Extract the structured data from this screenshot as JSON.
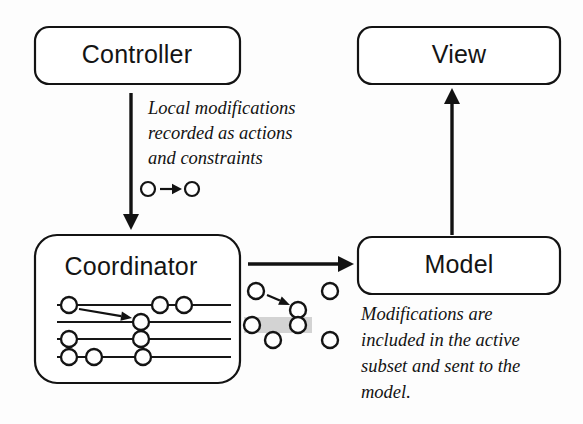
{
  "figure": {
    "background_color": "#fdfdfd",
    "ink_color": "#131313",
    "highlight_color": "#b9b9b9"
  },
  "nodes": [
    {
      "id": "controller",
      "label": "Controller",
      "x": 35,
      "y": 27,
      "w": 205,
      "h": 57,
      "r": 14
    },
    {
      "id": "view",
      "label": "View",
      "x": 358,
      "y": 27,
      "w": 202,
      "h": 57,
      "r": 14
    },
    {
      "id": "coordinator",
      "label": "Coordinator",
      "x": 35,
      "y": 235,
      "w": 205,
      "h": 148,
      "r": 22
    },
    {
      "id": "model",
      "label": "Model",
      "x": 358,
      "y": 237,
      "w": 202,
      "h": 57,
      "r": 14
    }
  ],
  "node_label_positions": [
    {
      "id": "controller-label",
      "x": 137,
      "y": 56
    },
    {
      "id": "view-label",
      "x": 459,
      "y": 56
    },
    {
      "id": "coordinator-label",
      "x": 131,
      "y": 268
    },
    {
      "id": "model-label",
      "x": 459,
      "y": 266
    }
  ],
  "connectors": [
    {
      "id": "controller-to-coordinator",
      "direction": "down",
      "x1": 131,
      "y1": 93,
      "x2": 131,
      "y2": 230
    },
    {
      "id": "coordinator-to-model",
      "direction": "right",
      "x1": 248,
      "y1": 264,
      "x2": 354,
      "y2": 264
    },
    {
      "id": "model-to-view",
      "direction": "up",
      "x1": 452,
      "y1": 235,
      "x2": 452,
      "y2": 88
    }
  ],
  "annotations": [
    {
      "id": "controller-annotation",
      "lines": [
        "Local modifications",
        "recorded as actions",
        "and constraints"
      ],
      "x": 148,
      "y_start": 110,
      "line_height": 25
    },
    {
      "id": "model-annotation",
      "lines": [
        "Modifications are",
        "included in the active",
        "subset and sent to the",
        "model."
      ],
      "x": 361,
      "y_start": 316,
      "line_height": 26
    }
  ],
  "legend": {
    "id": "action-legend",
    "description": "open circle, arrow, open circle",
    "left_circle": {
      "cx": 148,
      "cy": 189,
      "r": 7
    },
    "right_circle": {
      "cx": 192,
      "cy": 189,
      "r": 7
    },
    "arrow": {
      "x1": 160,
      "y1": 189,
      "x2": 182,
      "y2": 189
    }
  },
  "coordinator_timelines": {
    "description": "Four horizontal event timelines with open-circle events; one row highlighted; a diagonal arrow links an event on row 1 to an event on row 2.",
    "line_x_start": 57,
    "line_x_end": 231,
    "rows": [
      {
        "index": 0,
        "y": 305,
        "highlighted": false,
        "events": [
          69,
          160,
          184
        ]
      },
      {
        "index": 1,
        "y": 322,
        "highlighted": false,
        "events": [
          141
        ]
      },
      {
        "index": 2,
        "y": 339,
        "highlighted": true,
        "events": [
          69,
          141
        ],
        "band": {
          "x": 59,
          "y": 331,
          "w": 116,
          "h": 16
        }
      },
      {
        "index": 3,
        "y": 357,
        "highlighted": false,
        "events": [
          69,
          94,
          143
        ]
      }
    ],
    "event_radius": 8,
    "internal_arrow": {
      "x1": 79,
      "y1": 309,
      "x2": 132,
      "y2": 318
    }
  },
  "transfer_scatter": {
    "description": "Cluster of open circles representing the active subset being sent to the model; one horizontal band is highlighted; an arrow links two of the circles.",
    "circles": [
      {
        "cx": 256,
        "cy": 291
      },
      {
        "cx": 330,
        "cy": 291
      },
      {
        "cx": 298,
        "cy": 310
      },
      {
        "cx": 252,
        "cy": 325
      },
      {
        "cx": 298,
        "cy": 325
      },
      {
        "cx": 273,
        "cy": 340
      },
      {
        "cx": 330,
        "cy": 340
      }
    ],
    "radius": 8,
    "band": {
      "x": 244,
      "y": 317,
      "w": 68,
      "h": 16
    },
    "arrow": {
      "x1": 267,
      "y1": 295,
      "x2": 290,
      "y2": 305
    }
  }
}
